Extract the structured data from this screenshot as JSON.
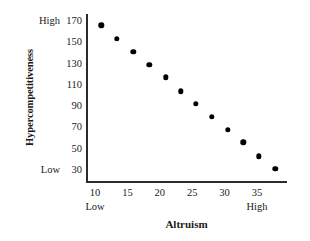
{
  "chart_data": {
    "type": "scatter",
    "title": "",
    "xlabel": "Altruism",
    "ylabel": "Hypercompetitiveness",
    "xlim": [
      7.5,
      39
    ],
    "ylim": [
      22,
      178
    ],
    "xticks": [
      10,
      15,
      20,
      25,
      30,
      35
    ],
    "yticks": [
      30,
      50,
      70,
      90,
      110,
      130,
      150,
      170
    ],
    "grid": false,
    "legend": null,
    "x_axis_low_label": "Low",
    "x_axis_high_label": "High",
    "y_axis_low_label": "Low",
    "y_axis_high_label": "High",
    "marker": "filled-circle",
    "marker_color": "#000000",
    "axis_color": "#2b2b2b",
    "background_color": "#ffffff",
    "points": [
      {
        "x": 11.0,
        "y": 166
      },
      {
        "x": 13.4,
        "y": 153
      },
      {
        "x": 15.9,
        "y": 141
      },
      {
        "x": 18.4,
        "y": 129
      },
      {
        "x": 20.9,
        "y": 117
      },
      {
        "x": 23.2,
        "y": 104
      },
      {
        "x": 25.6,
        "y": 92
      },
      {
        "x": 28.0,
        "y": 80
      },
      {
        "x": 30.5,
        "y": 68
      },
      {
        "x": 32.9,
        "y": 56
      },
      {
        "x": 35.3,
        "y": 43
      },
      {
        "x": 37.8,
        "y": 31
      }
    ],
    "relationship": "negative linear"
  },
  "axes": {
    "y_title": "Hypercompetitiveness",
    "x_title": "Altruism"
  }
}
